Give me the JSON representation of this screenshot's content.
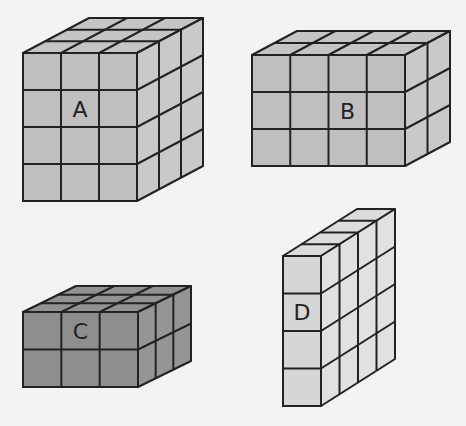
{
  "colors": {
    "background": "#f3f3f3",
    "stroke": "#222222",
    "light": "#c0c0c0",
    "lighter": "#d6d6d6",
    "dark": "#8e8e8e"
  },
  "cuboids": [
    {
      "label": "A",
      "cols": 3,
      "rows": 4,
      "depth": 3,
      "fill": "#bfbfbf",
      "front": {
        "x": 23,
        "y": 53,
        "w": 114,
        "h": 148
      },
      "offset": {
        "dx": 66,
        "dy": -35
      }
    },
    {
      "label": "B",
      "cols": 4,
      "rows": 3,
      "depth": 2,
      "fill": "#bfbfbf",
      "front": {
        "x": 252,
        "y": 55,
        "w": 153,
        "h": 111
      },
      "offset": {
        "dx": 45,
        "dy": -24
      }
    },
    {
      "label": "C",
      "cols": 3,
      "rows": 2,
      "depth": 3,
      "fill": "#8e8e8e",
      "front": {
        "x": 23,
        "y": 312,
        "w": 115,
        "h": 75
      },
      "offset": {
        "dx": 53,
        "dy": -26
      }
    },
    {
      "label": "D",
      "cols": 1,
      "rows": 4,
      "depth": 4,
      "fill": "#d6d6d6",
      "front": {
        "x": 283,
        "y": 256,
        "w": 38,
        "h": 150
      },
      "offset": {
        "dx": 74,
        "dy": -47
      }
    }
  ]
}
